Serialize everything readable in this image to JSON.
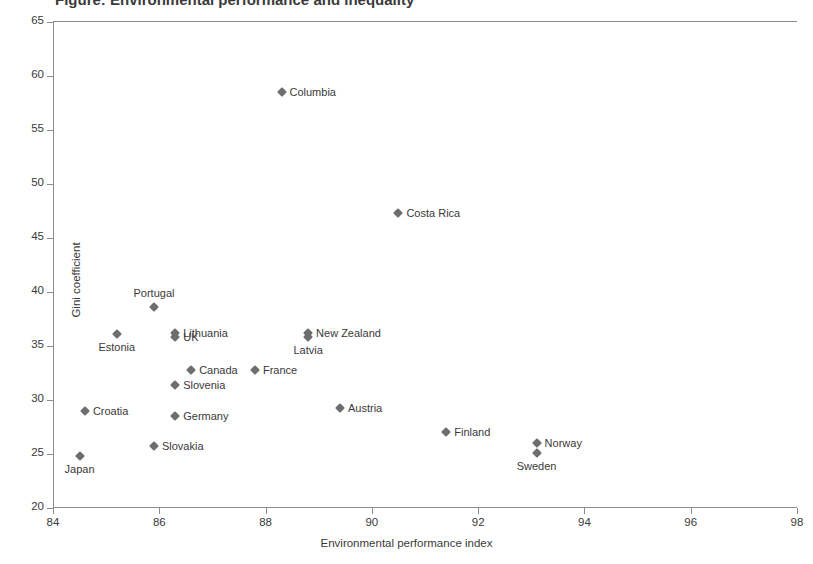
{
  "figure": {
    "cropped_title": "Figure: Environmental performance and inequality"
  },
  "chart_data": {
    "type": "scatter",
    "title": "",
    "xlabel": "Environmental performance index",
    "ylabel": "Gini coefficient",
    "xlim": [
      84,
      98
    ],
    "ylim": [
      20,
      65
    ],
    "xticks": [
      84,
      86,
      88,
      90,
      92,
      94,
      96,
      98
    ],
    "yticks": [
      20,
      25,
      30,
      35,
      40,
      45,
      50,
      55,
      60,
      65
    ],
    "grid": false,
    "legend": "none",
    "marker": "diamond",
    "marker_color": "#6e6e6e",
    "points": [
      {
        "name": "Columbia",
        "x": 88.3,
        "y": 58.5,
        "label_pos": "right"
      },
      {
        "name": "Costa Rica",
        "x": 90.5,
        "y": 47.3,
        "label_pos": "right"
      },
      {
        "name": "Portugal",
        "x": 85.9,
        "y": 38.6,
        "label_pos": "above"
      },
      {
        "name": "Lithuania",
        "x": 86.3,
        "y": 36.2,
        "label_pos": "right"
      },
      {
        "name": "UK",
        "x": 86.3,
        "y": 35.8,
        "label_pos": "right"
      },
      {
        "name": "Estonia",
        "x": 85.2,
        "y": 36.1,
        "label_pos": "below"
      },
      {
        "name": "New Zealand",
        "x": 88.8,
        "y": 36.2,
        "label_pos": "right"
      },
      {
        "name": "Latvia",
        "x": 88.8,
        "y": 35.8,
        "label_pos": "below"
      },
      {
        "name": "Canada",
        "x": 86.6,
        "y": 32.8,
        "label_pos": "right"
      },
      {
        "name": "France",
        "x": 87.8,
        "y": 32.8,
        "label_pos": "right"
      },
      {
        "name": "Slovenia",
        "x": 86.3,
        "y": 31.4,
        "label_pos": "right"
      },
      {
        "name": "Croatia",
        "x": 84.6,
        "y": 29.0,
        "label_pos": "right"
      },
      {
        "name": "Austria",
        "x": 89.4,
        "y": 29.3,
        "label_pos": "right"
      },
      {
        "name": "Germany",
        "x": 86.3,
        "y": 28.5,
        "label_pos": "right"
      },
      {
        "name": "Finland",
        "x": 91.4,
        "y": 27.0,
        "label_pos": "right"
      },
      {
        "name": "Norway",
        "x": 93.1,
        "y": 26.0,
        "label_pos": "right"
      },
      {
        "name": "Slovakia",
        "x": 85.9,
        "y": 25.7,
        "label_pos": "right"
      },
      {
        "name": "Sweden",
        "x": 93.1,
        "y": 25.1,
        "label_pos": "below"
      },
      {
        "name": "Japan",
        "x": 84.5,
        "y": 24.8,
        "label_pos": "below"
      }
    ]
  }
}
